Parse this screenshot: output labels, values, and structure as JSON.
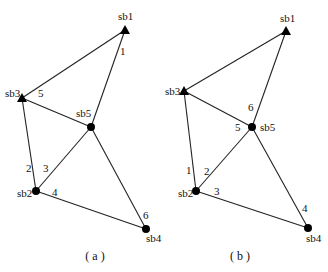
{
  "figures": [
    {
      "caption": "( a )",
      "caption_pos": [
        95,
        260
      ],
      "nodes": [
        {
          "id": "sb1",
          "label": "sb1",
          "shape": "triangle",
          "x": 125,
          "y": 30,
          "lx": 118,
          "ly": 20
        },
        {
          "id": "sb3",
          "label": "sb3",
          "shape": "triangle",
          "x": 22,
          "y": 98,
          "lx": 5,
          "ly": 97
        },
        {
          "id": "sb5",
          "label": "sb5",
          "shape": "circle",
          "x": 91,
          "y": 127,
          "lx": 76,
          "ly": 117
        },
        {
          "id": "sb2",
          "label": "sb2",
          "shape": "circle",
          "x": 36,
          "y": 191,
          "lx": 17,
          "ly": 197
        },
        {
          "id": "sb4",
          "label": "sb4",
          "shape": "circle",
          "x": 146,
          "y": 229,
          "lx": 146,
          "ly": 242
        }
      ],
      "edges": [
        {
          "from": "sb1",
          "to": "sb3",
          "label": "",
          "lx": 0,
          "ly": 0
        },
        {
          "from": "sb1",
          "to": "sb5",
          "label": "1",
          "lx": 120,
          "ly": 55
        },
        {
          "from": "sb3",
          "to": "sb5",
          "label": "5",
          "lx": 38,
          "ly": 97
        },
        {
          "from": "sb3",
          "to": "sb2",
          "label": "2",
          "lx": 26,
          "ly": 172
        },
        {
          "from": "sb5",
          "to": "sb2",
          "label": "3",
          "lx": 43,
          "ly": 172
        },
        {
          "from": "sb2",
          "to": "sb4",
          "label": "4",
          "lx": 52,
          "ly": 196
        },
        {
          "from": "sb5",
          "to": "sb4",
          "label": "6",
          "lx": 143,
          "ly": 219
        }
      ]
    },
    {
      "caption": "( b )",
      "caption_pos": [
        240,
        260
      ],
      "nodes": [
        {
          "id": "sb1",
          "label": "sb1",
          "shape": "triangle",
          "x": 286,
          "y": 31,
          "lx": 280,
          "ly": 22
        },
        {
          "id": "sb3",
          "label": "sb3",
          "shape": "triangle",
          "x": 184,
          "y": 91,
          "lx": 165,
          "ly": 95
        },
        {
          "id": "sb5",
          "label": "sb5",
          "shape": "circle",
          "x": 252,
          "y": 127,
          "lx": 260,
          "ly": 131
        },
        {
          "id": "sb2",
          "label": "sb2",
          "shape": "circle",
          "x": 196,
          "y": 191,
          "lx": 178,
          "ly": 197
        },
        {
          "id": "sb4",
          "label": "sb4",
          "shape": "circle",
          "x": 308,
          "y": 228,
          "lx": 306,
          "ly": 242
        }
      ],
      "edges": [
        {
          "from": "sb1",
          "to": "sb3",
          "label": "",
          "lx": 0,
          "ly": 0
        },
        {
          "from": "sb1",
          "to": "sb5",
          "label": "6",
          "lx": 248,
          "ly": 111
        },
        {
          "from": "sb3",
          "to": "sb5",
          "label": "5",
          "lx": 235,
          "ly": 131
        },
        {
          "from": "sb3",
          "to": "sb2",
          "label": "1",
          "lx": 186,
          "ly": 174
        },
        {
          "from": "sb5",
          "to": "sb2",
          "label": "2",
          "lx": 204,
          "ly": 175
        },
        {
          "from": "sb2",
          "to": "sb4",
          "label": "3",
          "lx": 214,
          "ly": 195
        },
        {
          "from": "sb5",
          "to": "sb4",
          "label": "4",
          "lx": 302,
          "ly": 212
        }
      ]
    }
  ]
}
